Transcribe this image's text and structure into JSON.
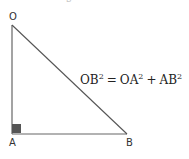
{
  "diagram": {
    "type": "right-triangle",
    "top_fragment": "B",
    "vertices": {
      "O": {
        "label": "O",
        "x": 12,
        "y": 25
      },
      "A": {
        "label": "A",
        "x": 12,
        "y": 134
      },
      "B": {
        "label": "B",
        "x": 127,
        "y": 134
      }
    },
    "right_angle_at": "A",
    "equation": {
      "lhs": "OB",
      "lhs_exp": "2",
      "equals": "=",
      "term1": "OA",
      "term1_exp": "2",
      "plus": "+",
      "term2": "AB",
      "term2_exp": "2"
    },
    "colors": {
      "line": "#555555",
      "right_angle_marker": "#555555",
      "text": "#222222"
    }
  }
}
